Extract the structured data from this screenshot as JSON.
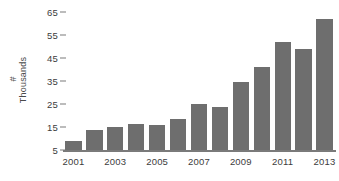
{
  "chart_data": {
    "type": "bar",
    "title": "",
    "xlabel": "",
    "ylabel": "# Thousands",
    "ylabel_parts": {
      "hash": "#",
      "word": "Thousands"
    },
    "categories": [
      "2001",
      "2002",
      "2003",
      "2004",
      "2005",
      "2006",
      "2007",
      "2008",
      "2009",
      "2010",
      "2011",
      "2012",
      "2013"
    ],
    "values": [
      9,
      13.5,
      15,
      16.5,
      16,
      18.5,
      25,
      23.5,
      34.5,
      41,
      52,
      49,
      62
    ],
    "series": [
      {
        "name": "count",
        "values": [
          9,
          13.5,
          15,
          16.5,
          16,
          18.5,
          25,
          23.5,
          34.5,
          41,
          52,
          49,
          62
        ]
      }
    ],
    "ylim": [
      5,
      65
    ],
    "yticks": [
      5,
      15,
      25,
      35,
      45,
      55,
      65
    ],
    "ytick_labels": [
      "5",
      "15",
      "25",
      "35",
      "45",
      "55",
      "65"
    ],
    "xtick_labels": [
      "2001",
      "2003",
      "2005",
      "2007",
      "2009",
      "2011",
      "2013"
    ],
    "xtick_categories": [
      "2001",
      "2003",
      "2005",
      "2007",
      "2009",
      "2011",
      "2013"
    ],
    "grid": false,
    "legend": false,
    "legend_position": "none",
    "bar_color": "#6e6e6e",
    "axis_color": "#7a7a7a",
    "text_color": "#3c3c3c",
    "background": "#ffffff"
  }
}
